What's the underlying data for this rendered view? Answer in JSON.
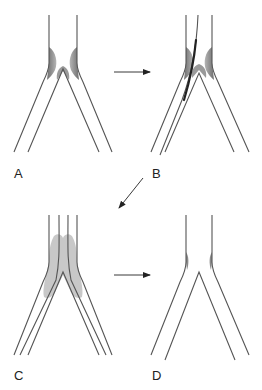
{
  "figure": {
    "panels": [
      {
        "id": "A",
        "label": "A",
        "state": "bifurcation stenosis with plaque"
      },
      {
        "id": "B",
        "label": "B",
        "state": "guidewires placed into both branches"
      },
      {
        "id": "C",
        "label": "C",
        "state": "kissing balloons / stents inflated"
      },
      {
        "id": "D",
        "label": "D",
        "state": "treated bifurcation"
      }
    ],
    "arrows": [
      {
        "from": "A",
        "to": "B",
        "direction": "right"
      },
      {
        "from": "B",
        "to": "C",
        "direction": "down-left"
      },
      {
        "from": "C",
        "to": "D",
        "direction": "right"
      }
    ],
    "colors": {
      "wall": "#555555",
      "plaque": "#8a8a8a",
      "balloon": "#c8c8c8",
      "wire": "#222222",
      "background": "#ffffff"
    }
  }
}
